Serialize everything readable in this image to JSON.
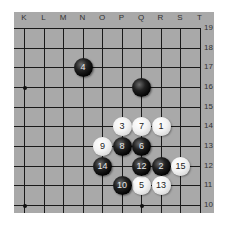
{
  "board": {
    "background": "#a9a9a9",
    "columns": [
      "K",
      "L",
      "M",
      "N",
      "O",
      "P",
      "Q",
      "R",
      "S",
      "T"
    ],
    "rows": [
      "19",
      "18",
      "17",
      "16",
      "15",
      "14",
      "13",
      "12",
      "11",
      "10"
    ],
    "star_points": [
      "K16",
      "K10",
      "Q10"
    ]
  },
  "stones": [
    {
      "point": "R14",
      "color": "white",
      "label": "1"
    },
    {
      "point": "R12",
      "color": "black",
      "label": "2"
    },
    {
      "point": "P14",
      "color": "white",
      "label": "3"
    },
    {
      "point": "N17",
      "color": "black",
      "label": "4"
    },
    {
      "point": "Q11",
      "color": "white",
      "label": "5"
    },
    {
      "point": "Q13",
      "color": "black",
      "label": "6"
    },
    {
      "point": "Q14",
      "color": "white",
      "label": "7"
    },
    {
      "point": "P13",
      "color": "black",
      "label": "8"
    },
    {
      "point": "O13",
      "color": "white",
      "label": "9"
    },
    {
      "point": "P11",
      "color": "black",
      "label": "10"
    },
    {
      "point": "Q12",
      "color": "black",
      "label": "12"
    },
    {
      "point": "R11",
      "color": "white",
      "label": "13"
    },
    {
      "point": "O12",
      "color": "black",
      "label": "14"
    },
    {
      "point": "S12",
      "color": "white",
      "label": "15"
    },
    {
      "point": "Q16",
      "color": "black",
      "label": ""
    }
  ]
}
